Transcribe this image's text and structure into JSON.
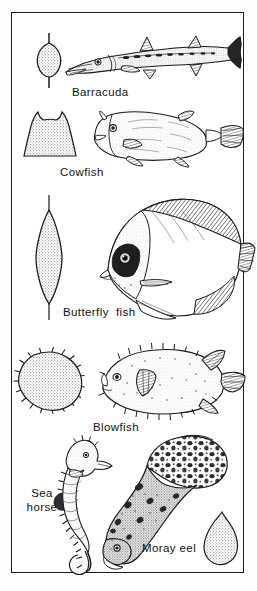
{
  "plate": {
    "title": "Fish body shapes and cross sections",
    "background_color": "#ffffff",
    "ink_color": "#1a1a1a",
    "border_color": "#1a1a1a",
    "stipple_color": "#b9b9b9"
  },
  "entries": [
    {
      "id": "barracuda",
      "label": "Barracuda",
      "cross_section_shape": "narrow-vertical-oval",
      "cross_section_name": "barracuda-cross-section",
      "fish_name": "barracuda-illustration"
    },
    {
      "id": "cowfish",
      "label": "Cowfish",
      "cross_section_shape": "boxy-horned-trapezoid",
      "cross_section_name": "cowfish-cross-section",
      "fish_name": "cowfish-illustration"
    },
    {
      "id": "butterfly_fish",
      "label": "Butterfly  fish",
      "cross_section_shape": "tall-thin-lens",
      "cross_section_name": "butterfly-fish-cross-section",
      "fish_name": "butterfly-fish-illustration"
    },
    {
      "id": "blowfish",
      "label": "Blowfish",
      "cross_section_shape": "spiky-circle",
      "cross_section_name": "blowfish-cross-section",
      "fish_name": "blowfish-illustration"
    },
    {
      "id": "sea_horse",
      "label": "Sea\nhorse",
      "cross_section_shape": "none",
      "cross_section_name": "",
      "fish_name": "sea-horse-illustration"
    },
    {
      "id": "moray_eel",
      "label": "Moray eel",
      "cross_section_shape": "teardrop",
      "cross_section_name": "moray-eel-cross-section",
      "fish_name": "moray-eel-illustration"
    }
  ]
}
